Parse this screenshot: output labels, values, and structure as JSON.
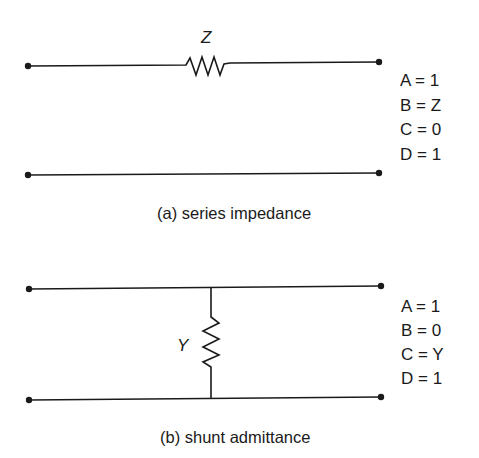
{
  "part_a": {
    "component_label": "Z",
    "params": [
      "A = 1",
      "B = Z",
      "C = 0",
      "D = 1"
    ],
    "caption": "(a) series impedance"
  },
  "part_b": {
    "component_label": "Y",
    "params": [
      "A = 1",
      "B = 0",
      "C = Y",
      "D = 1"
    ],
    "caption": "(b) shunt admittance"
  }
}
